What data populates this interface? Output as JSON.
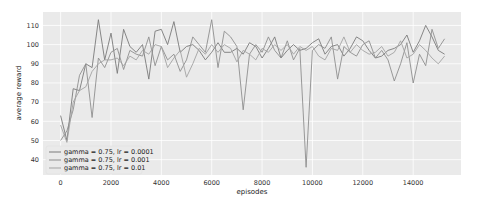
{
  "chart_data": {
    "type": "line",
    "title": "",
    "xlabel": "episodes",
    "ylabel": "average reward",
    "xlim": [
      -700,
      15900
    ],
    "ylim": [
      32,
      117
    ],
    "xticks": [
      0,
      2000,
      4000,
      6000,
      8000,
      10000,
      12000,
      14000
    ],
    "xtick_labels": [
      "0",
      "2000",
      "4000",
      "6000",
      "8000",
      "10000",
      "12000",
      "14000"
    ],
    "yticks": [
      40,
      50,
      60,
      70,
      80,
      90,
      100,
      110
    ],
    "ytick_labels": [
      "40",
      "50",
      "60",
      "70",
      "80",
      "90",
      "100",
      "110"
    ],
    "grid": true,
    "legend_position": "bottom-left",
    "background": "#eaeaea",
    "x": [
      0,
      250,
      500,
      750,
      1000,
      1250,
      1500,
      1750,
      2000,
      2250,
      2500,
      2750,
      3000,
      3250,
      3500,
      3750,
      4000,
      4250,
      4500,
      4750,
      5000,
      5250,
      5500,
      5750,
      6000,
      6250,
      6500,
      6750,
      7000,
      7250,
      7500,
      7750,
      8000,
      8250,
      8500,
      8750,
      9000,
      9250,
      9500,
      9750,
      10000,
      10250,
      10500,
      10750,
      11000,
      11250,
      11500,
      11750,
      12000,
      12250,
      12500,
      12750,
      13000,
      13250,
      13500,
      13750,
      14000,
      14250,
      14500,
      14750,
      15000,
      15250
    ],
    "series": [
      {
        "name": "gamma = 0.75, lr = 0.0001",
        "color": "#7a7a7a",
        "values": [
          63,
          50,
          77,
          76,
          90,
          88,
          113,
          92,
          106,
          85,
          108,
          99,
          96,
          100,
          82,
          107,
          108,
          100,
          112,
          96,
          99,
          100,
          97,
          92,
          96,
          101,
          96,
          96,
          98,
          95,
          101,
          99,
          93,
          98,
          104,
          93,
          97,
          100,
          97,
          98,
          101,
          103,
          95,
          99,
          100,
          94,
          98,
          104,
          102,
          97,
          93,
          94,
          97,
          98,
          100,
          105,
          96,
          102,
          110,
          104,
          97,
          95
        ]
      },
      {
        "name": "gamma = 0.75, lr = 0.001",
        "color": "#8e8e8e",
        "values": [
          50,
          55,
          66,
          84,
          90,
          62,
          93,
          88,
          96,
          98,
          87,
          97,
          95,
          94,
          104,
          89,
          99,
          92,
          95,
          86,
          92,
          104,
          100,
          96,
          113,
          88,
          107,
          104,
          99,
          66,
          95,
          100,
          96,
          104,
          97,
          93,
          102,
          92,
          98,
          36,
          97,
          100,
          98,
          104,
          82,
          99,
          96,
          94,
          100,
          102,
          93,
          97,
          92,
          81,
          90,
          101,
          80,
          95,
          89,
          108,
          98,
          103
        ]
      },
      {
        "name": "gamma = 0.75, lr = 0.01",
        "color": "#a3a3a3",
        "values": [
          58,
          49,
          70,
          76,
          78,
          86,
          90,
          92,
          92,
          93,
          89,
          94,
          92,
          97,
          95,
          100,
          99,
          88,
          93,
          97,
          83,
          90,
          98,
          95,
          100,
          96,
          100,
          98,
          91,
          97,
          95,
          92,
          98,
          96,
          100,
          97,
          100,
          95,
          99,
          97,
          99,
          94,
          92,
          98,
          97,
          104,
          96,
          100,
          97,
          95,
          96,
          99,
          94,
          96,
          102,
          93,
          95,
          100,
          97,
          93,
          90,
          94
        ]
      }
    ]
  }
}
